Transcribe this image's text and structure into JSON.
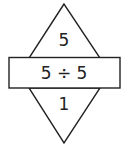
{
  "top_value": "5",
  "expression": "5 ÷ 5",
  "bottom_value": "1",
  "colors": {
    "stroke": "#222222",
    "background": "#ffffff"
  }
}
